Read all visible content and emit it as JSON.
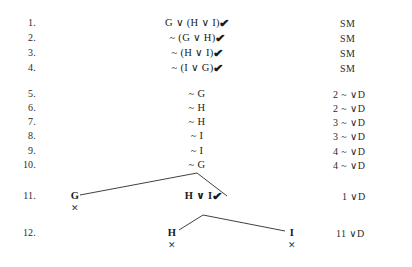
{
  "document": {
    "type": "truth-tree-proof",
    "background_color": "#ffffff",
    "text_color": "#1a1a1a",
    "check_mark": "✔",
    "closure_mark": "✕"
  },
  "columns": {
    "number_label": "",
    "formula_label": "",
    "justification_label": ""
  },
  "lines": [
    {
      "number": "1.",
      "formula": "G ∨ (H ∨ I)",
      "checked": true,
      "justification": "SM"
    },
    {
      "number": "2.",
      "formula": "~ (G ∨ H)",
      "checked": true,
      "justification": "SM"
    },
    {
      "number": "3.",
      "formula": "~ (H ∨ I)",
      "checked": true,
      "justification": "SM"
    },
    {
      "number": "4.",
      "formula": "~ (I ∨ G)",
      "checked": true,
      "justification": "SM"
    },
    {
      "number": "5.",
      "formula": "~ G",
      "checked": false,
      "justification": "2  ~ ∨D"
    },
    {
      "number": "6.",
      "formula": "~ H",
      "checked": false,
      "justification": "2  ~ ∨D"
    },
    {
      "number": "7.",
      "formula": "~ H",
      "checked": false,
      "justification": "3  ~ ∨D"
    },
    {
      "number": "8.",
      "formula": "~ I",
      "checked": false,
      "justification": "3  ~ ∨D"
    },
    {
      "number": "9.",
      "formula": "~ I",
      "checked": false,
      "justification": "4  ~ ∨D"
    },
    {
      "number": "10.",
      "formula": "~ G",
      "checked": false,
      "justification": "4  ~ ∨D"
    },
    {
      "number": "11.",
      "formula": "",
      "checked": false,
      "justification": "1  ∨D"
    },
    {
      "number": "12.",
      "formula": "",
      "checked": false,
      "justification": "11  ∨D"
    }
  ],
  "branch_nodes": [
    {
      "id": "node-g",
      "label": "G",
      "checked": false,
      "closed": true,
      "line": "11"
    },
    {
      "id": "node-hvi",
      "label": "H ∨ I",
      "checked": true,
      "closed": false,
      "line": "11"
    },
    {
      "id": "node-h",
      "label": "H",
      "checked": false,
      "closed": true,
      "line": "12"
    },
    {
      "id": "node-i",
      "label": "I",
      "checked": false,
      "closed": true,
      "line": "12"
    }
  ]
}
